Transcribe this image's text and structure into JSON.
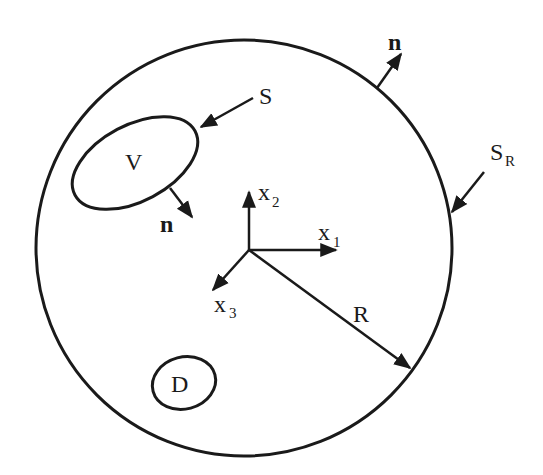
{
  "diagram": {
    "colors": {
      "ink": "#1a1a1a",
      "background": "#ffffff"
    },
    "outer_sphere": {
      "boundary_label": "S",
      "boundary_subscript": "R",
      "normal_label": "n"
    },
    "inclusion_v": {
      "region_label": "V",
      "surface_label": "S",
      "normal_label": "n"
    },
    "inclusion_d": {
      "region_label": "D"
    },
    "axes": {
      "x1": {
        "base": "x",
        "sub": "1"
      },
      "x2": {
        "base": "x",
        "sub": "2"
      },
      "x3": {
        "base": "x",
        "sub": "3"
      }
    },
    "radius_label": "R"
  }
}
